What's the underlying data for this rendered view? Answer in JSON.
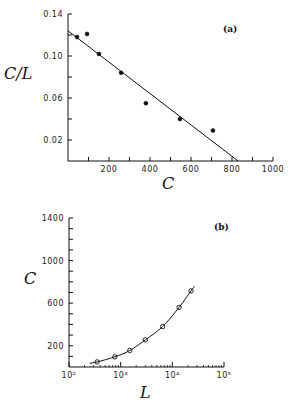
{
  "chart_data": [
    {
      "id": "a",
      "type": "scatter",
      "panel_label": "(a)",
      "title": "",
      "xlabel": "C",
      "ylabel": "C/L",
      "xlim": [
        0,
        1000
      ],
      "ylim": [
        0,
        0.14
      ],
      "x_ticks": [
        200,
        400,
        600,
        800,
        1000
      ],
      "x_tick_labels": [
        "200",
        "400",
        "600",
        "800",
        "1000"
      ],
      "y_ticks": [
        0.02,
        0.06,
        0.1,
        0.14
      ],
      "y_tick_labels": [
        "0.02",
        "0.06",
        "0.10",
        "0.14"
      ],
      "grid": false,
      "series": [
        {
          "name": "data",
          "marker": "filled-circle",
          "x": [
            44,
            93,
            151,
            259,
            380,
            546,
            707
          ],
          "y": [
            0.118,
            0.121,
            0.102,
            0.084,
            0.055,
            0.04,
            0.029
          ]
        },
        {
          "name": "linear fit",
          "style": "line",
          "x": [
            0,
            830
          ],
          "y": [
            0.124,
            0.0
          ]
        }
      ]
    },
    {
      "id": "b",
      "type": "line",
      "panel_label": "(b)",
      "title": "",
      "xlabel": "L",
      "ylabel": "C",
      "xscale": "log",
      "xlim": [
        100,
        100000
      ],
      "ylim": [
        0,
        1400
      ],
      "x_ticks": [
        100,
        1000,
        10000,
        100000
      ],
      "x_tick_labels": [
        "10²",
        "10³",
        "10⁴",
        "10⁵"
      ],
      "y_ticks": [
        200,
        600,
        1000,
        1400
      ],
      "y_tick_labels": [
        "200",
        "600",
        "1000",
        "1400"
      ],
      "grid": false,
      "series": [
        {
          "name": "data",
          "marker": "open-circle",
          "x": [
            350,
            770,
            1500,
            3000,
            6500,
            13500,
            23000
          ],
          "y": [
            48,
            95,
            155,
            255,
            380,
            560,
            715
          ]
        },
        {
          "name": "fit curve",
          "style": "line",
          "x": [
            250,
            350,
            770,
            1500,
            3000,
            6500,
            13500,
            23000,
            27000
          ],
          "y": [
            35,
            48,
            95,
            155,
            255,
            380,
            560,
            715,
            760
          ]
        }
      ]
    }
  ]
}
